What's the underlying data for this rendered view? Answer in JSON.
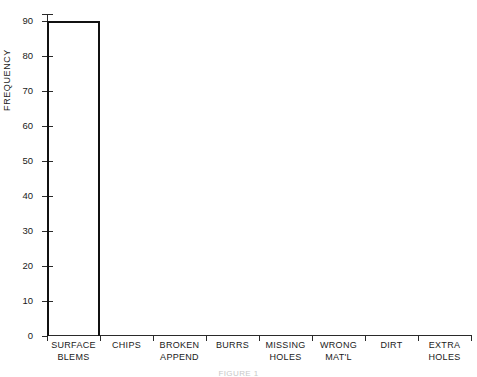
{
  "chart_data": {
    "type": "bar",
    "title": "",
    "subtitle": "",
    "xlabel": "",
    "ylabel": "FREQUENCY",
    "categories": [
      "SURFACE\nBLEMS",
      "CHIPS",
      "BROKEN\nAPPEND",
      "BURRS",
      "MISSING\nHOLES",
      "WRONG\nMAT'L",
      "DIRT",
      "EXTRA\nHOLES"
    ],
    "values": [
      90,
      0,
      0,
      0,
      0,
      0,
      0,
      0
    ],
    "ylim": [
      0,
      92
    ],
    "ytick_labels": [
      "0",
      "10",
      "20",
      "30",
      "40",
      "50",
      "60",
      "70",
      "80",
      "90"
    ],
    "ytick_values": [
      0,
      10,
      20,
      30,
      40,
      50,
      60,
      70,
      80,
      90
    ],
    "grid": false,
    "legend": false,
    "legend_position": "none",
    "bar_style": "outline",
    "colors": {
      "bar_outline": "#111111",
      "axis": "#2a2a2a",
      "text": "#1a1a1a",
      "background": "#ffffff"
    }
  },
  "axis": {
    "y_title": "FREQUENCY"
  },
  "caption": {
    "text": "FIGURE 1"
  }
}
